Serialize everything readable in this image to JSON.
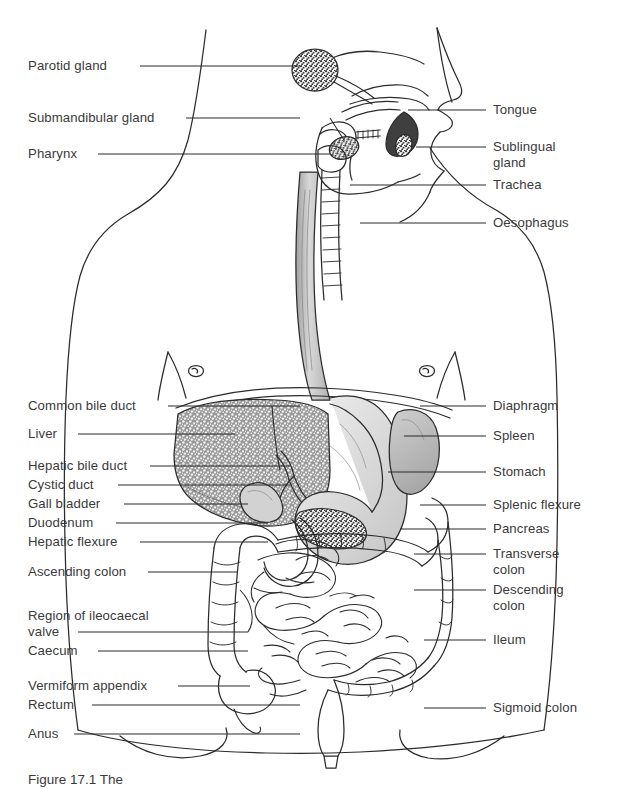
{
  "figure": {
    "caption": "Figure 17.1 The",
    "background": "#ffffff",
    "ink": "#2a2a2a"
  },
  "labels_left": [
    {
      "text": "Parotid gland",
      "x": 28,
      "y": 58,
      "line_y": 66,
      "line_x1": 140,
      "line_x2": 300
    },
    {
      "text": "Submandibular gland",
      "x": 28,
      "y": 110,
      "line_y": 118,
      "line_x1": 186,
      "line_x2": 300
    },
    {
      "text": "Pharynx",
      "x": 28,
      "y": 146,
      "line_y": 154,
      "line_x1": 98,
      "line_x2": 330
    },
    {
      "text": "Common bile duct",
      "x": 28,
      "y": 398,
      "line_y": 406,
      "line_x1": 168,
      "line_x2": 300
    },
    {
      "text": "Liver",
      "x": 28,
      "y": 426,
      "line_y": 434,
      "line_x1": 78,
      "line_x2": 235
    },
    {
      "text": "Hepatic bile duct",
      "x": 28,
      "y": 458,
      "line_y": 466,
      "line_x1": 150,
      "line_x2": 290
    },
    {
      "text": "Cystic duct",
      "x": 28,
      "y": 477,
      "line_y": 485,
      "line_x1": 118,
      "line_x2": 290
    },
    {
      "text": "Gall bladder",
      "x": 28,
      "y": 496,
      "line_y": 504,
      "line_x1": 124,
      "line_x2": 248
    },
    {
      "text": "Duodenum",
      "x": 28,
      "y": 515,
      "line_y": 523,
      "line_x1": 116,
      "line_x2": 268
    },
    {
      "text": "Hepatic flexure",
      "x": 28,
      "y": 534,
      "line_y": 542,
      "line_x1": 140,
      "line_x2": 268
    },
    {
      "text": "Ascending colon",
      "x": 28,
      "y": 564,
      "line_y": 572,
      "line_x1": 148,
      "line_x2": 238
    },
    {
      "text": "Region of ileocaecal",
      "x": 28,
      "y": 608,
      "line_y": 0,
      "line_x1": 0,
      "line_x2": 0
    },
    {
      "text": "valve",
      "x": 28,
      "y": 624,
      "line_y": 632,
      "line_x1": 78,
      "line_x2": 248
    },
    {
      "text": "Caecum",
      "x": 28,
      "y": 643,
      "line_y": 651,
      "line_x1": 98,
      "line_x2": 248
    },
    {
      "text": "Vermiform appendix",
      "x": 28,
      "y": 678,
      "line_y": 686,
      "line_x1": 178,
      "line_x2": 250
    },
    {
      "text": "Rectum",
      "x": 28,
      "y": 697,
      "line_y": 705,
      "line_x1": 92,
      "line_x2": 300
    },
    {
      "text": "Anus",
      "x": 28,
      "y": 726,
      "line_y": 734,
      "line_x1": 74,
      "line_x2": 300
    }
  ],
  "labels_right": [
    {
      "text": "Tongue",
      "x": 493,
      "y": 102,
      "line_y": 110,
      "line_x1": 408,
      "line_x2": 486
    },
    {
      "text": "Sublingual",
      "x": 493,
      "y": 139,
      "line_y": 147,
      "line_x1": 416,
      "line_x2": 486
    },
    {
      "text": "gland",
      "x": 493,
      "y": 155,
      "line_y": 0,
      "line_x1": 0,
      "line_x2": 0
    },
    {
      "text": "Trachea",
      "x": 493,
      "y": 177,
      "line_y": 185,
      "line_x1": 350,
      "line_x2": 486
    },
    {
      "text": "Oesophagus",
      "x": 493,
      "y": 215,
      "line_y": 223,
      "line_x1": 360,
      "line_x2": 486
    },
    {
      "text": "Diaphragm",
      "x": 493,
      "y": 398,
      "line_y": 406,
      "line_x1": 420,
      "line_x2": 486
    },
    {
      "text": "Spleen",
      "x": 493,
      "y": 428,
      "line_y": 436,
      "line_x1": 404,
      "line_x2": 486
    },
    {
      "text": "Stomach",
      "x": 493,
      "y": 464,
      "line_y": 472,
      "line_x1": 388,
      "line_x2": 486
    },
    {
      "text": "Splenic flexure",
      "x": 493,
      "y": 497,
      "line_y": 505,
      "line_x1": 420,
      "line_x2": 486
    },
    {
      "text": "Pancreas",
      "x": 493,
      "y": 521,
      "line_y": 529,
      "line_x1": 400,
      "line_x2": 486
    },
    {
      "text": "Transverse",
      "x": 493,
      "y": 546,
      "line_y": 554,
      "line_x1": 414,
      "line_x2": 486
    },
    {
      "text": "colon",
      "x": 493,
      "y": 562,
      "line_y": 0,
      "line_x1": 0,
      "line_x2": 0
    },
    {
      "text": "Descending",
      "x": 493,
      "y": 582,
      "line_y": 590,
      "line_x1": 414,
      "line_x2": 486
    },
    {
      "text": "colon",
      "x": 493,
      "y": 598,
      "line_y": 0,
      "line_x1": 0,
      "line_x2": 0
    },
    {
      "text": "Ileum",
      "x": 493,
      "y": 632,
      "line_y": 640,
      "line_x1": 424,
      "line_x2": 486
    },
    {
      "text": "Sigmoid colon",
      "x": 493,
      "y": 700,
      "line_y": 708,
      "line_x1": 424,
      "line_x2": 486
    }
  ],
  "organs": [
    {
      "name": "parotid-gland",
      "fill": "stipple-dark"
    },
    {
      "name": "submandibular-gland",
      "fill": "stipple-dark"
    },
    {
      "name": "sublingual-gland",
      "fill": "stipple-dark"
    },
    {
      "name": "tongue",
      "fill": "#4a4a4a"
    },
    {
      "name": "oesophagus",
      "fill": "#c9c9c9"
    },
    {
      "name": "liver",
      "fill": "stipple-liver"
    },
    {
      "name": "stomach",
      "fill": "#d8d8d8"
    },
    {
      "name": "spleen",
      "fill": "#b9b9b9"
    },
    {
      "name": "pancreas",
      "fill": "stipple-dark"
    },
    {
      "name": "gall-bladder",
      "fill": "#cfcfcf"
    },
    {
      "name": "duodenum",
      "fill": "#ffffff"
    },
    {
      "name": "small-intestine",
      "fill": "#ffffff"
    },
    {
      "name": "large-intestine",
      "fill": "#ffffff"
    },
    {
      "name": "rectum",
      "fill": "#ffffff"
    },
    {
      "name": "body-outline",
      "fill": "none"
    }
  ]
}
